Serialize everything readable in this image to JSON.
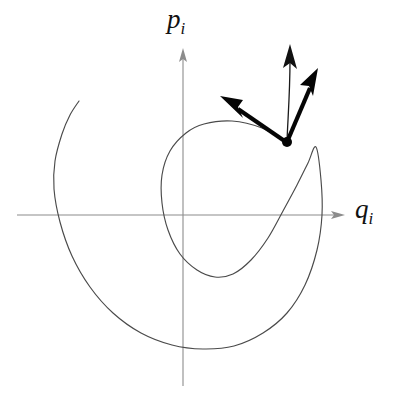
{
  "figure": {
    "background_color": "#ffffff",
    "width": 394,
    "height": 399
  },
  "axes": {
    "horizontal": {
      "name": "q-axis",
      "label_base": "q",
      "label_subscript": "i",
      "color": "#8c8c8c",
      "y_pixel": 215,
      "x_start": 17,
      "x_end": 345,
      "arrow": "right"
    },
    "vertical": {
      "name": "p-axis",
      "label_base": "p",
      "label_subscript": "i",
      "color": "#8c8c8c",
      "x_pixel": 183,
      "y_start": 386,
      "y_end": 48,
      "arrow": "up"
    },
    "origin": {
      "x": 183,
      "y": 215
    }
  },
  "curve": {
    "name": "spiral-trajectory",
    "color": "#4a4a4a",
    "stroke_width": 1.15,
    "description": "outward spiral trajectory in the q-p plane",
    "free_end": {
      "x": 79,
      "y": 101
    }
  },
  "marked_point": {
    "name": "state-point",
    "x": 287,
    "y": 142,
    "radius": 5.0,
    "color": "#050505"
  },
  "vectors": [
    {
      "name": "tangent-vector-left",
      "style": "thick",
      "color": "#050505",
      "from": {
        "x": 287,
        "y": 142
      },
      "to": {
        "x": 221,
        "y": 97
      }
    },
    {
      "name": "tangent-vector-right",
      "style": "thick",
      "color": "#050505",
      "from": {
        "x": 287,
        "y": 142
      },
      "to": {
        "x": 318,
        "y": 69
      }
    },
    {
      "name": "curved-flow-vector",
      "style": "thin-curved",
      "color": "#111111",
      "from": {
        "x": 287,
        "y": 142
      },
      "to": {
        "x": 290,
        "y": 45
      }
    }
  ],
  "chart_data": {
    "type": "line",
    "title": "",
    "xlabel": "q_i",
    "ylabel": "p_i",
    "grid": false,
    "legend": null,
    "annotations": [
      {
        "label": "state point",
        "x_pixel": 287,
        "y_pixel": 142
      },
      {
        "label": "tangent vector (left)",
        "x_pixel": 221,
        "y_pixel": 97
      },
      {
        "label": "tangent vector (right)",
        "x_pixel": 318,
        "y_pixel": 69
      },
      {
        "label": "curved flow vector",
        "x_pixel": 290,
        "y_pixel": 45
      }
    ],
    "series": [
      {
        "name": "spiral trajectory",
        "description": "Outward-winding spiral in phase space, drawn as a single continuous curve from an inner tilted loop to an outer arc that terminates at upper-left.",
        "path_pixels": [
          [
            287,
            142
          ],
          [
            262,
            128
          ],
          [
            232,
            121
          ],
          [
            204,
            124
          ],
          [
            186,
            133
          ],
          [
            170,
            151
          ],
          [
            162,
            175
          ],
          [
            162,
            203
          ],
          [
            168,
            230
          ],
          [
            180,
            254
          ],
          [
            197,
            270
          ],
          [
            215,
            277
          ],
          [
            233,
            274
          ],
          [
            251,
            260
          ],
          [
            268,
            238
          ],
          [
            283,
            211
          ],
          [
            297,
            185
          ],
          [
            308,
            163
          ],
          [
            316,
            147
          ],
          [
            321,
            180
          ],
          [
            322,
            215
          ],
          [
            317,
            250
          ],
          [
            305,
            285
          ],
          [
            287,
            313
          ],
          [
            263,
            333
          ],
          [
            234,
            346
          ],
          [
            203,
            349
          ],
          [
            172,
            345
          ],
          [
            141,
            333
          ],
          [
            113,
            313
          ],
          [
            90,
            287
          ],
          [
            72,
            256
          ],
          [
            60,
            222
          ],
          [
            54,
            189
          ],
          [
            55,
            161
          ],
          [
            62,
            134
          ],
          [
            70,
            115
          ],
          [
            79,
            101
          ]
        ]
      }
    ]
  }
}
